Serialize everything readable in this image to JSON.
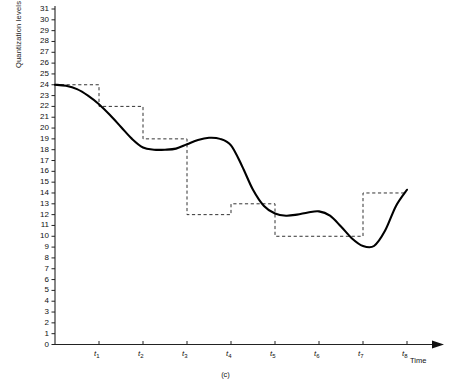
{
  "figure": {
    "caption": "(c)",
    "y_axis": {
      "label": "Quantization levels",
      "ticks": [
        0,
        1,
        2,
        3,
        4,
        5,
        6,
        7,
        8,
        9,
        10,
        11,
        12,
        13,
        14,
        15,
        16,
        17,
        18,
        19,
        20,
        21,
        22,
        23,
        24,
        25,
        26,
        27,
        28,
        29,
        30,
        31
      ],
      "min": 0,
      "max": 31
    },
    "x_axis": {
      "label": "Time",
      "tick_labels": [
        "t1",
        "t2",
        "t3",
        "t4",
        "t5",
        "t6",
        "t7",
        "t8"
      ],
      "tick_bases": [
        "t",
        "t",
        "t",
        "t",
        "t",
        "t",
        "t",
        "t"
      ],
      "tick_subs": [
        "1",
        "2",
        "3",
        "4",
        "5",
        "6",
        "7",
        "8"
      ]
    },
    "colors": {
      "curve": "#000000",
      "staircase": "#333333",
      "axis": "#222222",
      "background": "#ffffff"
    }
  },
  "chart_data": {
    "type": "line",
    "title": "",
    "xlabel": "Time",
    "ylabel": "Quantization levels",
    "ylim": [
      0,
      31
    ],
    "grid": false,
    "legend": "none",
    "categories": [
      "t1",
      "t2",
      "t3",
      "t4",
      "t5",
      "t6",
      "t7",
      "t8"
    ],
    "series": [
      {
        "name": "analog signal",
        "style": "solid",
        "x": [
          0.0,
          0.25,
          0.5,
          0.75,
          1.0,
          1.25,
          1.5,
          1.75,
          2.0,
          2.25,
          2.5,
          2.75,
          3.0,
          3.25,
          3.5,
          3.75,
          4.0,
          4.25,
          4.5,
          4.75,
          5.0,
          5.25,
          5.5,
          5.75,
          6.0,
          6.25,
          6.5,
          6.75,
          7.0,
          7.25,
          7.5,
          7.75,
          8.0
        ],
        "values": [
          24.0,
          23.9,
          23.6,
          23.0,
          22.2,
          21.2,
          20.1,
          19.0,
          18.2,
          18.0,
          18.0,
          18.1,
          18.5,
          18.9,
          19.1,
          19.0,
          18.4,
          16.5,
          14.3,
          12.8,
          12.1,
          11.9,
          12.0,
          12.2,
          12.3,
          11.9,
          10.9,
          9.8,
          9.1,
          9.1,
          10.5,
          12.8,
          14.3
        ]
      },
      {
        "name": "quantized staircase",
        "style": "dashed",
        "step_intervals": [
          "0-t1",
          "t1-t2",
          "t2-t3",
          "t3-t4",
          "t4-t5",
          "t5-t6",
          "t6-t7",
          "t7-t8"
        ],
        "values": [
          24,
          22,
          19,
          12,
          13,
          10,
          10,
          14
        ]
      }
    ]
  }
}
